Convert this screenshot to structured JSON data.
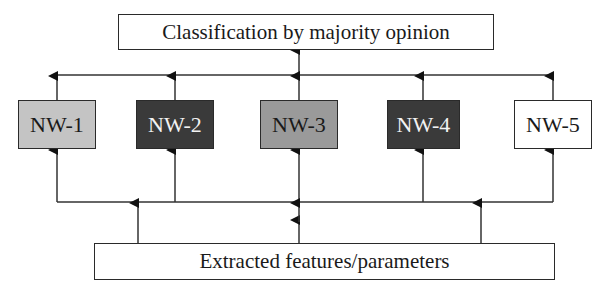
{
  "diagram": {
    "top_box": {
      "label": "Classification by majority opinion"
    },
    "bottom_box": {
      "label": "Extracted features/parameters"
    },
    "networks": [
      {
        "label": "NW-1",
        "fill": "#c4c4c4",
        "text_color": "#1a1a1a"
      },
      {
        "label": "NW-2",
        "fill": "#3a3a3a",
        "text_color": "#f2f2f2"
      },
      {
        "label": "NW-3",
        "fill": "#9a9a9a",
        "text_color": "#1a1a1a"
      },
      {
        "label": "NW-4",
        "fill": "#3a3a3a",
        "text_color": "#f2f2f2"
      },
      {
        "label": "NW-5",
        "fill": "#ffffff",
        "text_color": "#1a1a1a"
      }
    ],
    "flow": "features -> NW-1..NW-5 -> majority vote classification"
  }
}
